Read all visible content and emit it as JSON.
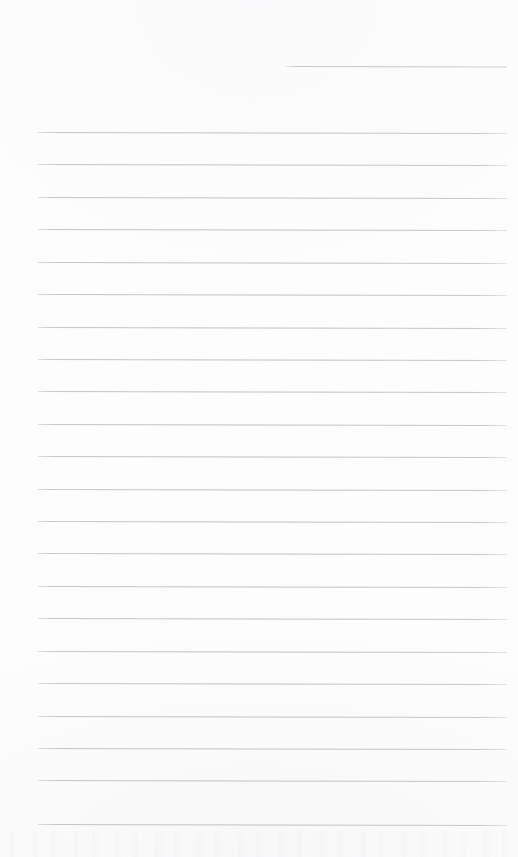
{
  "document": {
    "kind": "blank-lined-page",
    "title": "",
    "body_text": "",
    "page_width": 518,
    "page_height": 857,
    "background_color": "#fdfdfd",
    "rule_color": "#c4c4ca",
    "rule_thickness_px": 1,
    "skew_degrees": 0.13
  },
  "header_rule": {
    "name": "header-rule",
    "x_start": 285,
    "x_end": 507,
    "y": 66,
    "length": 222
  },
  "body_rules": {
    "x_start": 38,
    "x_end": 507,
    "length": 469,
    "first_y": 132,
    "spacing": 32.4,
    "count": 22,
    "positions": [
      132,
      164,
      197,
      229,
      262,
      294,
      327,
      359,
      391,
      424,
      456,
      489,
      521,
      553,
      586,
      618,
      651,
      683,
      716,
      748,
      780,
      824
    ]
  },
  "content_lines": [
    "",
    "",
    "",
    "",
    "",
    "",
    "",
    "",
    "",
    "",
    "",
    "",
    "",
    "",
    "",
    "",
    "",
    "",
    "",
    "",
    "",
    ""
  ]
}
